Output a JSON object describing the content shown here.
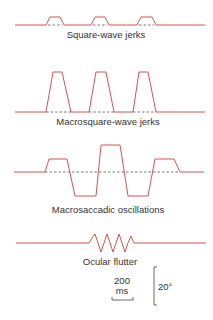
{
  "colors": {
    "trace": "#d9534f",
    "baseline_dash": "#555555",
    "text": "#333333"
  },
  "panels": [
    {
      "id": "square-wave-jerks",
      "label": "Square-wave jerks"
    },
    {
      "id": "macrosquare-wave-jerks",
      "label": "Macrosquare-wave jerks"
    },
    {
      "id": "macrosaccadic-oscillations",
      "label": "Macrosaccadic oscillations"
    },
    {
      "id": "ocular-flutter",
      "label": "Ocular flutter"
    }
  ],
  "scale_bars": {
    "time": {
      "value": "200",
      "unit": "ms"
    },
    "amplitude": {
      "value": "20°"
    }
  }
}
